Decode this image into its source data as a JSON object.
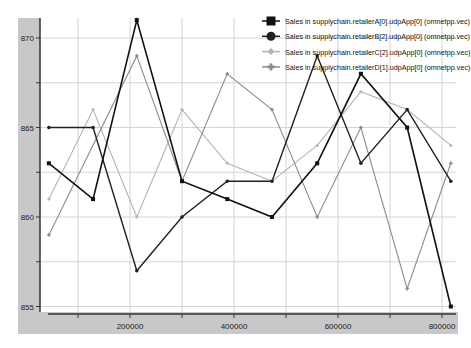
{
  "chart_data": {
    "type": "line",
    "title": "",
    "xlabel": "",
    "ylabel": "",
    "xlim": [
      0,
      830000
    ],
    "ylim": [
      854.5,
      872
    ],
    "x_ticks": [
      100000,
      200000,
      300000,
      400000,
      500000,
      600000,
      700000,
      800000
    ],
    "x_tick_labels": [
      "",
      "200000",
      "",
      "400000",
      "",
      "600000",
      "",
      "800000"
    ],
    "y_ticks": [
      855,
      857.5,
      860,
      862.5,
      865,
      867.5,
      870
    ],
    "y_tick_labels": [
      "855",
      "",
      "860",
      "",
      "865",
      "",
      "870"
    ],
    "grid": true,
    "legend_position": "top-right",
    "series": [
      {
        "name": "Sales in supplychain.retailerA[0].udpApp[0] (omnetpp.vec)",
        "marker": "square",
        "color": "#111111",
        "width": 1.6,
        "x": [
          44000,
          129000,
          213000,
          300000,
          387000,
          473000,
          560000,
          644000,
          733000,
          817000
        ],
        "values": [
          863,
          861,
          871,
          862,
          861,
          860,
          863,
          868,
          865,
          855
        ]
      },
      {
        "name": "Sales in supplychain.retailerB[2].udpApp[0] (omnetpp.vec)",
        "marker": "circle",
        "color": "#222222",
        "width": 1.4,
        "x": [
          44000,
          129000,
          213000,
          300000,
          387000,
          473000,
          560000,
          644000,
          733000,
          817000
        ],
        "values": [
          865,
          865,
          857,
          860,
          862,
          862,
          869,
          863,
          866,
          862
        ]
      },
      {
        "name": "Sales in supplychain.retailerC[2].udpApp[0] (omnetpp.vec)",
        "marker": "diamond",
        "color": "#b4b4b4",
        "width": 1.1,
        "x": [
          44000,
          129000,
          213000,
          300000,
          387000,
          473000,
          560000,
          644000,
          733000,
          817000
        ],
        "values": [
          861,
          866,
          860,
          866,
          863,
          862,
          864,
          867,
          866,
          864
        ]
      },
      {
        "name": "Sales in supplychain.retailerD[1].udpApp[0] (omnetpp.vec)",
        "marker": "plus",
        "color": "#8c8c8c",
        "width": 1.1,
        "x": [
          44000,
          213000,
          300000,
          387000,
          473000,
          560000,
          644000,
          733000,
          817000
        ],
        "values": [
          859,
          869,
          862,
          868,
          866,
          860,
          865,
          856,
          863
        ]
      }
    ]
  },
  "layout": {
    "panel_color": "#c8c8c8",
    "grid_color": "#d4d4d4",
    "axis_color": "#333333"
  }
}
